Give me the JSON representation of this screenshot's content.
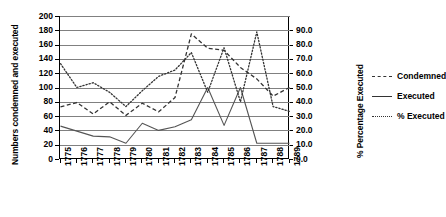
{
  "chart_data": {
    "type": "line",
    "title": "",
    "xlabel": "",
    "ylabel": "Numbers condemned and executed",
    "y2label": "% Percentage Executed",
    "grid": true,
    "legend_position": "right",
    "x": [
      "1775",
      "1776",
      "1777",
      "1778",
      "1779",
      "1780",
      "1781",
      "1782",
      "1783",
      "1784",
      "1785",
      "1786",
      "1787",
      "1788",
      "1789"
    ],
    "ylim": [
      0,
      200
    ],
    "yticks": [
      "0",
      "20",
      "40",
      "60",
      "80",
      "100",
      "120",
      "140",
      "160",
      "180",
      "200"
    ],
    "y2lim": [
      0,
      90
    ],
    "y2ticks": [
      "0.0",
      "10.0",
      "20.0",
      "30.0",
      "40.0",
      "50.0",
      "60.0",
      "70.0",
      "80.0",
      "90.0"
    ],
    "series": [
      {
        "name": "Condemned",
        "axis": "left",
        "style": "dashed",
        "color": "#333333",
        "values": [
          73,
          79,
          63,
          80,
          61,
          78,
          66,
          86,
          175,
          155,
          152,
          128,
          112,
          88,
          100
        ]
      },
      {
        "name": "Executed",
        "axis": "left",
        "style": "solid",
        "color": "#555555",
        "values": [
          46,
          39,
          32,
          31,
          22,
          50,
          40,
          45,
          55,
          100,
          47,
          100,
          22,
          22,
          22
        ]
      },
      {
        "name": "% Executed",
        "axis": "right",
        "style": "dotted",
        "color": "#333333",
        "values": [
          60.0,
          45.0,
          48.0,
          42.0,
          33.0,
          43.0,
          52.0,
          56.0,
          67.0,
          42.0,
          70.0,
          36.0,
          80.0,
          33.0,
          30.0
        ]
      }
    ]
  },
  "legend": {
    "items": [
      {
        "label": "Condemned",
        "key": "dashed-line-key"
      },
      {
        "label": "Executed",
        "key": "solid-line-key"
      },
      {
        "label": "% Executed",
        "key": "dotted-line-key"
      }
    ]
  }
}
